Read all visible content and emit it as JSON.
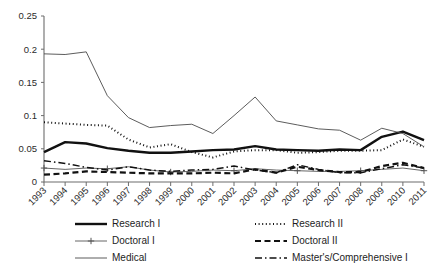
{
  "chart_data": {
    "type": "line",
    "title": "",
    "xlabel": "",
    "ylabel": "",
    "ylim": [
      0,
      0.25
    ],
    "ytick_step": 0.05,
    "yticks": [
      "0",
      "0.05",
      "0.1",
      "0.15",
      "0.2",
      "0.25"
    ],
    "ytick_values": [
      0,
      0.05,
      0.1,
      0.15,
      0.2,
      0.25
    ],
    "grid": false,
    "legend_position": "bottom",
    "categories": [
      "1993",
      "1994",
      "1995",
      "1996",
      "1997",
      "1998",
      "1999",
      "2000",
      "2001",
      "2002",
      "2003",
      "2004",
      "2005",
      "2006",
      "2007",
      "2008",
      "2009",
      "2010",
      "2011"
    ],
    "series": [
      {
        "name": "Research I",
        "style": "solid-thick",
        "color": "#111111",
        "width": 2.4,
        "dash": "none",
        "marker": "none",
        "values": [
          0.045,
          0.06,
          0.058,
          0.051,
          0.047,
          0.044,
          0.044,
          0.046,
          0.048,
          0.049,
          0.054,
          0.049,
          0.048,
          0.047,
          0.049,
          0.048,
          0.068,
          0.076,
          0.063
        ]
      },
      {
        "name": "Research II",
        "style": "dotted",
        "color": "#111111",
        "width": 2.0,
        "dash": "1,2.6",
        "marker": "none",
        "values": [
          0.09,
          0.088,
          0.086,
          0.085,
          0.064,
          0.052,
          0.057,
          0.045,
          0.037,
          0.046,
          0.048,
          0.048,
          0.044,
          0.045,
          0.047,
          0.047,
          0.048,
          0.064,
          0.053
        ]
      },
      {
        "name": "Doctoral I",
        "style": "solid-thin-plus",
        "color": "#555555",
        "width": 0.9,
        "dash": "none",
        "marker": "plus",
        "values": [
          0.021,
          0.019,
          0.021,
          0.02,
          0.023,
          0.018,
          0.015,
          0.016,
          0.018,
          0.017,
          0.02,
          0.018,
          0.017,
          0.016,
          0.016,
          0.017,
          0.019,
          0.021,
          0.017
        ]
      },
      {
        "name": "Doctoral II",
        "style": "dashed",
        "color": "#111111",
        "width": 2.2,
        "dash": "6,3.5",
        "marker": "none",
        "values": [
          0.011,
          0.013,
          0.016,
          0.015,
          0.014,
          0.013,
          0.013,
          0.013,
          0.014,
          0.013,
          0.019,
          0.014,
          0.023,
          0.018,
          0.015,
          0.015,
          0.024,
          0.029,
          0.021
        ]
      },
      {
        "name": "Medical",
        "style": "solid-thin",
        "color": "#4a4a4a",
        "width": 0.9,
        "dash": "none",
        "marker": "none",
        "values": [
          0.193,
          0.192,
          0.196,
          0.13,
          0.097,
          0.082,
          0.085,
          0.087,
          0.073,
          0.1,
          0.128,
          0.092,
          0.086,
          0.08,
          0.078,
          0.063,
          0.081,
          0.073,
          0.053
        ]
      },
      {
        "name": "Master's/Comprehensive I",
        "style": "dash-dot",
        "color": "#111111",
        "width": 1.5,
        "dash": "7,3,1.5,3",
        "marker": "none",
        "values": [
          0.032,
          0.028,
          0.022,
          0.018,
          0.023,
          0.018,
          0.016,
          0.018,
          0.019,
          0.024,
          0.018,
          0.014,
          0.026,
          0.019,
          0.014,
          0.014,
          0.02,
          0.026,
          0.021
        ]
      }
    ]
  },
  "legend": {
    "entries": [
      {
        "label": "Research I",
        "series": 0,
        "col": 0,
        "row": 0
      },
      {
        "label": "Research II",
        "series": 1,
        "col": 1,
        "row": 0
      },
      {
        "label": "Doctoral I",
        "series": 2,
        "col": 0,
        "row": 1
      },
      {
        "label": "Doctoral II",
        "series": 3,
        "col": 1,
        "row": 1
      },
      {
        "label": "Medical",
        "series": 4,
        "col": 0,
        "row": 2
      },
      {
        "label": "Master's/Comprehensive I",
        "series": 5,
        "col": 1,
        "row": 2
      }
    ]
  },
  "layout": {
    "plot_left": 44,
    "plot_right": 424,
    "plot_top": 16,
    "plot_bottom": 182,
    "legend_col_x": [
      75,
      255
    ],
    "legend_sample_width": 32,
    "legend_row_y": [
      224,
      241,
      258
    ]
  }
}
